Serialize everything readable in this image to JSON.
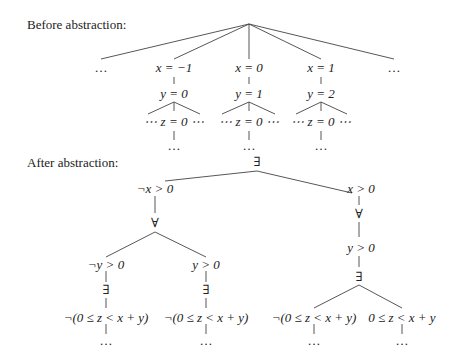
{
  "before": {
    "heading": "Before abstraction:",
    "root_children": [
      "…",
      "x = −1",
      "x = 0",
      "x = 1",
      "…"
    ],
    "branches": [
      {
        "x": "x = −1",
        "y": "y = 0",
        "z_row": "⋯ z = 0 ⋯",
        "below": "…"
      },
      {
        "x": "x = 0",
        "y": "y = 1",
        "z_row": "⋯ z = 0 ⋯",
        "below": "…"
      },
      {
        "x": "x = 1",
        "y": "y = 2",
        "z_row": "⋯ z = 0 ⋯",
        "below": "…"
      }
    ],
    "ellipsis": "…",
    "z_label": "z = 0"
  },
  "after": {
    "heading": "After abstraction:",
    "root": "∃",
    "left": {
      "node": "¬x > 0",
      "quant": "∀",
      "children": [
        {
          "node": "¬y > 0",
          "quant": "∃",
          "formula": "¬(0 ≤ z < x + y)",
          "below": "…"
        },
        {
          "node": "y > 0",
          "quant": "∃",
          "formula": "¬(0 ≤ z < x + y)",
          "below": "…"
        }
      ]
    },
    "right": {
      "node": "x > 0",
      "quant": "∀",
      "sub": "y > 0",
      "quant2": "∃",
      "children": [
        {
          "formula": "¬(0 ≤ z < x + y)",
          "below": "…"
        },
        {
          "formula": "0 ≤ z < x + y",
          "below": "…"
        }
      ]
    }
  }
}
